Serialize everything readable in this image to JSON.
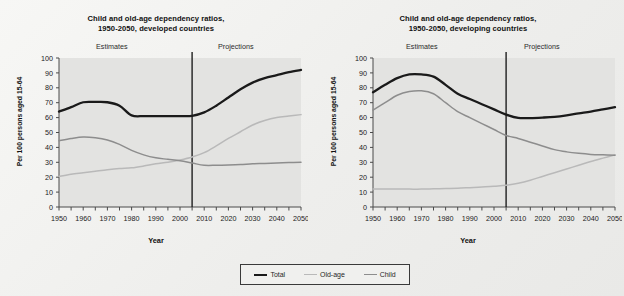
{
  "figure": {
    "axis_label_y": "Per 100 persons aged 15-64",
    "axis_label_x": "Year",
    "phase_left": "Estimates",
    "phase_right": "Projections"
  },
  "legend": {
    "items": [
      {
        "label": "Total",
        "color": "#1a1a1a",
        "key": "sw-total"
      },
      {
        "label": "Old-age",
        "color": "#b9b9b9",
        "key": "sw-old"
      },
      {
        "label": "Child",
        "color": "#8d8d8d",
        "key": "sw-child"
      }
    ]
  },
  "chart_data": [
    {
      "type": "line",
      "title": "Child and old-age dependency ratios, 1950-2050, developed countries",
      "title_line1": "Child and old-age dependency ratios,",
      "title_line2": "1950-2050, developed countries",
      "xlabel": "Year",
      "ylabel": "Per 100 persons aged 15-64",
      "xlim": [
        1950,
        2050
      ],
      "ylim": [
        0,
        100
      ],
      "ytick_values": [
        0,
        10,
        20,
        30,
        40,
        50,
        60,
        70,
        80,
        90,
        100
      ],
      "xtick_labels": [
        "1950",
        "1960",
        "1970",
        "1980",
        "1990",
        "2000",
        "2010",
        "2020",
        "2030",
        "2040",
        "2050"
      ],
      "xtick_values": [
        1950,
        1960,
        1970,
        1980,
        1990,
        2000,
        2010,
        2020,
        2030,
        2040,
        2050
      ],
      "grid": false,
      "legend_position": "bottom-center-shared",
      "divider_year": 2005,
      "annotations": [
        {
          "text": "Estimates",
          "x": 1978
        },
        {
          "text": "Projections",
          "x": 2030
        }
      ],
      "x": [
        1950,
        1955,
        1960,
        1965,
        1970,
        1975,
        1980,
        1985,
        1990,
        1995,
        2000,
        2005,
        2010,
        2015,
        2020,
        2025,
        2030,
        2035,
        2040,
        2045,
        2050
      ],
      "series": [
        {
          "name": "Total",
          "color": "#1a1a1a",
          "values": [
            64,
            67,
            70.3,
            70.5,
            70.3,
            68,
            61.5,
            61,
            61,
            61,
            61,
            61.2,
            63.5,
            68,
            73.5,
            79,
            83.5,
            86.5,
            88.5,
            90.5,
            92
          ]
        },
        {
          "name": "Old-age",
          "color": "#b9b9b9",
          "values": [
            20.5,
            22,
            23,
            24,
            25,
            25.8,
            26.3,
            27.5,
            29,
            30,
            31.5,
            33.5,
            36.5,
            41,
            46,
            50.5,
            55,
            58,
            60,
            61,
            62
          ]
        },
        {
          "name": "Child",
          "color": "#8d8d8d",
          "values": [
            44.5,
            46,
            47,
            46.5,
            45,
            42,
            38,
            35,
            33,
            32,
            31,
            29.5,
            28,
            28,
            28.2,
            28.5,
            29,
            29.2,
            29.5,
            29.8,
            30
          ]
        }
      ]
    },
    {
      "type": "line",
      "title": "Child and old-age dependency ratios, 1950-2050, developing countries",
      "title_line1": "Child and old-age dependency ratios,",
      "title_line2": "1950-2050, developing countries",
      "xlabel": "Year",
      "ylabel": "Per 100 persons aged 15-64",
      "xlim": [
        1950,
        2050
      ],
      "ylim": [
        0,
        100
      ],
      "ytick_values": [
        0,
        10,
        20,
        30,
        40,
        50,
        60,
        70,
        80,
        90,
        100
      ],
      "xtick_labels": [
        "1950",
        "1960",
        "1970",
        "1980",
        "1990",
        "2000",
        "2010",
        "2020",
        "2030",
        "2040",
        "2050"
      ],
      "xtick_values": [
        1950,
        1960,
        1970,
        1980,
        1990,
        2000,
        2010,
        2020,
        2030,
        2040,
        2050
      ],
      "grid": false,
      "legend_position": "bottom-center-shared",
      "divider_year": 2005,
      "annotations": [
        {
          "text": "Estimates",
          "x": 1978
        },
        {
          "text": "Projections",
          "x": 2030
        }
      ],
      "x": [
        1950,
        1955,
        1960,
        1965,
        1970,
        1975,
        1980,
        1985,
        1990,
        1995,
        2000,
        2005,
        2010,
        2015,
        2020,
        2025,
        2030,
        2035,
        2040,
        2045,
        2050
      ],
      "series": [
        {
          "name": "Total",
          "color": "#1a1a1a",
          "values": [
            77,
            82,
            86.5,
            89,
            89,
            87.5,
            82,
            76,
            72.5,
            69,
            65.5,
            62,
            59.8,
            59.7,
            60,
            60.5,
            61.5,
            62.8,
            64,
            65.5,
            67
          ]
        },
        {
          "name": "Old-age",
          "color": "#b9b9b9",
          "values": [
            12,
            12,
            12,
            12,
            12,
            12.2,
            12.4,
            12.6,
            13,
            13.4,
            14,
            14.6,
            16,
            18,
            20.5,
            23,
            25.5,
            28,
            30.5,
            32.8,
            35
          ]
        },
        {
          "name": "Child",
          "color": "#8d8d8d",
          "values": [
            65,
            70,
            75,
            77.5,
            78,
            76,
            70,
            64,
            60,
            56,
            52,
            48,
            46,
            43.5,
            41,
            38.5,
            37,
            36,
            35.3,
            35,
            34.8
          ]
        }
      ]
    }
  ]
}
